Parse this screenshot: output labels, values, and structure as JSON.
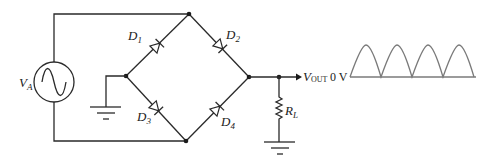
{
  "diagram": {
    "type": "full-wave bridge rectifier circuit",
    "source": {
      "label": "V",
      "subscript": "A",
      "icon": "ac-sine-source-icon"
    },
    "diodes": [
      {
        "label": "D",
        "subscript": "1"
      },
      {
        "label": "D",
        "subscript": "2"
      },
      {
        "label": "D",
        "subscript": "3"
      },
      {
        "label": "D",
        "subscript": "4"
      }
    ],
    "load": {
      "label": "R",
      "subscript": "L"
    },
    "output": {
      "label": "V",
      "subscript": "OUT"
    },
    "waveform": {
      "baseline_label": "0 V",
      "description": "full-wave rectified sine",
      "humps": 4,
      "color": "#7a7a7a"
    }
  },
  "colors": {
    "wire": "#2a2a2a",
    "waveform": "#7a7a7a",
    "background": "#ffffff"
  }
}
